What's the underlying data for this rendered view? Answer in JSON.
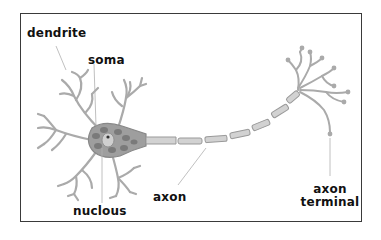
{
  "diagram": {
    "labels": {
      "dendrite": "dendrite",
      "soma": "soma",
      "nucleus": "nuclous",
      "axon": "axon",
      "axon_terminal_line1": "axon",
      "axon_terminal_line2": "terminal"
    },
    "colors": {
      "frame": "#3a3a3a",
      "cell_fill": "#b9b9b9",
      "cell_outline": "#8a8a8a",
      "soma_fill": "#9a9a9a",
      "organelle": "#6e6e6e",
      "leader_line": "#aaaaaa",
      "label_text": "#111111"
    }
  }
}
